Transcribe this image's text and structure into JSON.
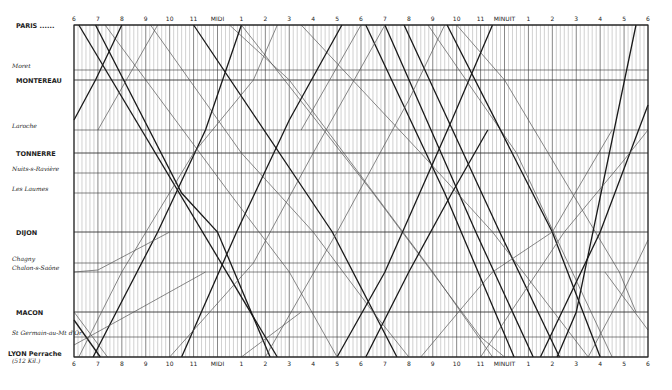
{
  "chart_data": {
    "type": "line",
    "title": "",
    "xlabel": "",
    "ylabel": "",
    "x_ticks_top": [
      "6",
      "7",
      "8",
      "9",
      "10",
      "11",
      "MIDI",
      "1",
      "2",
      "3",
      "4",
      "5",
      "6",
      "7",
      "8",
      "9",
      "10",
      "11",
      "MINUIT",
      "1",
      "2",
      "3",
      "4",
      "5",
      "6"
    ],
    "x_ticks_bottom": [
      "6",
      "7",
      "8",
      "9",
      "10",
      "11",
      "MIDI",
      "1",
      "2",
      "3",
      "4",
      "5",
      "6",
      "7",
      "8",
      "9",
      "10",
      "11",
      "MINUIT",
      "1",
      "2",
      "3",
      "4",
      "5",
      "6"
    ],
    "x_range_hours": [
      6,
      30
    ],
    "grid": true,
    "stations": [
      {
        "name": "PARIS",
        "suffix": "......",
        "y": 25,
        "style": "major"
      },
      {
        "name": "Moret",
        "y": 70,
        "style": "minor"
      },
      {
        "name": "MONTEREAU",
        "y": 80,
        "style": "major"
      },
      {
        "name": "Laroche",
        "y": 130,
        "style": "minor"
      },
      {
        "name": "TONNERRE",
        "y": 153,
        "style": "major"
      },
      {
        "name": "Nuits-s-Ravière",
        "y": 173,
        "style": "minor"
      },
      {
        "name": "Les Laumes",
        "y": 193,
        "style": "minor"
      },
      {
        "name": "DIJON",
        "y": 232,
        "style": "major"
      },
      {
        "name": "Chagny",
        "y": 263,
        "style": "minor"
      },
      {
        "name": "Chalon-s-Saône",
        "y": 272,
        "style": "minor"
      },
      {
        "name": "MACON",
        "y": 312,
        "style": "major"
      },
      {
        "name": "St Germain-au-Mt d'Or",
        "y": 337,
        "style": "minor"
      },
      {
        "name": "LYON Perrache",
        "sub": "(512 Kil.)",
        "y": 357,
        "style": "major"
      }
    ],
    "series": [
      {
        "name": "down-express-1",
        "dir": "PL",
        "bold": true,
        "points": [
          [
            6.2,
            25
          ],
          [
            14.5,
            357
          ]
        ]
      },
      {
        "name": "down-2",
        "dir": "PL",
        "bold": true,
        "points": [
          [
            6.9,
            25
          ],
          [
            10.5,
            193
          ],
          [
            12.0,
            232
          ],
          [
            14.2,
            357
          ]
        ]
      },
      {
        "name": "down-3",
        "dir": "PL",
        "bold": false,
        "points": [
          [
            7.3,
            25
          ],
          [
            9.0,
            80
          ],
          [
            12.5,
            193
          ],
          [
            15.0,
            272
          ],
          [
            17.0,
            357
          ]
        ]
      },
      {
        "name": "down-4",
        "dir": "PL",
        "bold": true,
        "points": [
          [
            11.0,
            25
          ],
          [
            16.8,
            232
          ],
          [
            19.5,
            357
          ]
        ]
      },
      {
        "name": "down-5",
        "dir": "PL",
        "bold": false,
        "points": [
          [
            9.2,
            25
          ],
          [
            13.0,
            153
          ],
          [
            16.0,
            232
          ],
          [
            18.5,
            312
          ],
          [
            20.0,
            357
          ]
        ]
      },
      {
        "name": "down-6",
        "dir": "PL",
        "bold": false,
        "points": [
          [
            13.0,
            25
          ],
          [
            18.5,
            193
          ],
          [
            23.0,
            337
          ],
          [
            24.0,
            357
          ]
        ]
      },
      {
        "name": "down-7",
        "dir": "PL",
        "bold": false,
        "points": [
          [
            12.5,
            25
          ],
          [
            15.0,
            80
          ],
          [
            21.0,
            272
          ],
          [
            23.5,
            357
          ]
        ]
      },
      {
        "name": "down-8",
        "dir": "PL",
        "bold": true,
        "points": [
          [
            18.2,
            25
          ],
          [
            21.5,
            193
          ],
          [
            24.4,
            357
          ]
        ]
      },
      {
        "name": "down-9",
        "dir": "PL",
        "bold": true,
        "points": [
          [
            19.0,
            25
          ],
          [
            22.8,
            232
          ],
          [
            25.2,
            357
          ]
        ]
      },
      {
        "name": "down-10",
        "dir": "PL",
        "bold": true,
        "points": [
          [
            19.8,
            25
          ],
          [
            23.8,
            232
          ],
          [
            26.3,
            357
          ]
        ]
      },
      {
        "name": "down-11",
        "dir": "PL",
        "bold": false,
        "points": [
          [
            20.8,
            25
          ],
          [
            24.5,
            153
          ],
          [
            28.5,
            357
          ]
        ]
      },
      {
        "name": "down-12",
        "dir": "PL",
        "bold": true,
        "points": [
          [
            21.6,
            25
          ],
          [
            26.0,
            232
          ],
          [
            28.0,
            357
          ]
        ]
      },
      {
        "name": "down-13",
        "dir": "PL",
        "bold": false,
        "points": [
          [
            22.0,
            25
          ],
          [
            24.0,
            80
          ],
          [
            28.8,
            272
          ],
          [
            29.5,
            312
          ]
        ]
      },
      {
        "name": "down-14",
        "dir": "PL",
        "bold": false,
        "points": [
          [
            15.5,
            25
          ],
          [
            20.5,
            153
          ],
          [
            23.5,
            232
          ],
          [
            27.5,
            357
          ]
        ]
      },
      {
        "name": "down-local-a",
        "dir": "PL",
        "bold": false,
        "points": [
          [
            6.0,
            312
          ],
          [
            7.4,
            357
          ]
        ]
      },
      {
        "name": "down-local-b",
        "dir": "PL",
        "bold": true,
        "points": [
          [
            6.0,
            320
          ],
          [
            7.1,
            357
          ]
        ]
      },
      {
        "name": "down-local-c",
        "dir": "PL",
        "bold": false,
        "points": [
          [
            28.2,
            272
          ],
          [
            30.0,
            330
          ]
        ]
      },
      {
        "name": "up-1",
        "dir": "LP",
        "bold": true,
        "points": [
          [
            6.0,
            120
          ],
          [
            6.9,
            80
          ],
          [
            8.0,
            25
          ]
        ]
      },
      {
        "name": "up-2",
        "dir": "LP",
        "bold": true,
        "points": [
          [
            6.8,
            357
          ],
          [
            9.5,
            232
          ],
          [
            11.5,
            130
          ],
          [
            13.0,
            25
          ]
        ]
      },
      {
        "name": "up-3",
        "dir": "LP",
        "bold": false,
        "points": [
          [
            6.2,
            357
          ],
          [
            8.0,
            272
          ],
          [
            11.0,
            153
          ],
          [
            13.5,
            80
          ],
          [
            14.5,
            25
          ]
        ]
      },
      {
        "name": "up-4",
        "dir": "LP",
        "bold": true,
        "points": [
          [
            10.5,
            357
          ],
          [
            12.8,
            232
          ],
          [
            15.0,
            120
          ],
          [
            17.2,
            25
          ]
        ]
      },
      {
        "name": "up-5",
        "dir": "LP",
        "bold": false,
        "points": [
          [
            10.0,
            357
          ],
          [
            13.5,
            263
          ],
          [
            16.0,
            153
          ],
          [
            19.0,
            25
          ]
        ]
      },
      {
        "name": "up-6",
        "dir": "LP",
        "bold": false,
        "points": [
          [
            14.0,
            357
          ],
          [
            17.0,
            232
          ],
          [
            20.0,
            100
          ],
          [
            21.5,
            25
          ]
        ]
      },
      {
        "name": "up-7",
        "dir": "LP",
        "bold": true,
        "points": [
          [
            17.0,
            357
          ],
          [
            19.0,
            272
          ],
          [
            21.8,
            120
          ],
          [
            23.5,
            25
          ]
        ]
      },
      {
        "name": "up-8",
        "dir": "LP",
        "bold": true,
        "points": [
          [
            18.2,
            357
          ],
          [
            20.0,
            272
          ],
          [
            21.8,
            193
          ],
          [
            23.3,
            130
          ]
        ]
      },
      {
        "name": "up-9",
        "dir": "LP",
        "bold": false,
        "points": [
          [
            20.5,
            357
          ],
          [
            22.5,
            300
          ],
          [
            23.5,
            272
          ],
          [
            26.0,
            232
          ],
          [
            28.5,
            130
          ]
        ]
      },
      {
        "name": "up-10",
        "dir": "LP",
        "bold": true,
        "points": [
          [
            26.2,
            357
          ],
          [
            27.0,
            312
          ],
          [
            29.5,
            25
          ]
        ]
      },
      {
        "name": "up-11",
        "dir": "LP",
        "bold": true,
        "points": [
          [
            25.5,
            357
          ],
          [
            28.0,
            232
          ],
          [
            30.0,
            105
          ]
        ]
      },
      {
        "name": "up-12",
        "dir": "LP",
        "bold": false,
        "points": [
          [
            27.5,
            357
          ],
          [
            29.0,
            290
          ],
          [
            30.0,
            240
          ]
        ]
      },
      {
        "name": "up-13",
        "dir": "LP",
        "bold": false,
        "points": [
          [
            23.0,
            357
          ],
          [
            26.5,
            232
          ],
          [
            29.0,
            160
          ],
          [
            30.0,
            130
          ]
        ]
      },
      {
        "name": "up-local-a",
        "dir": "LP",
        "bold": false,
        "points": [
          [
            6.0,
            272
          ],
          [
            7.0,
            270
          ],
          [
            10.0,
            232
          ]
        ]
      },
      {
        "name": "up-local-b",
        "dir": "LP",
        "bold": false,
        "points": [
          [
            6.0,
            345
          ],
          [
            8.5,
            312
          ],
          [
            11.5,
            272
          ]
        ]
      },
      {
        "name": "up-local-c",
        "dir": "LP",
        "bold": false,
        "points": [
          [
            7.0,
            130
          ],
          [
            9.5,
            25
          ]
        ]
      },
      {
        "name": "up-local-d",
        "dir": "LP",
        "bold": false,
        "points": [
          [
            15.5,
            130
          ],
          [
            18.0,
            25
          ]
        ]
      },
      {
        "name": "up-local-e",
        "dir": "LP",
        "bold": false,
        "points": [
          [
            13.0,
            357
          ],
          [
            15.5,
            312
          ]
        ]
      }
    ]
  },
  "layout": {
    "plot_left": 74,
    "plot_right": 648,
    "plot_top": 25,
    "plot_bottom": 357,
    "top_label_y": 21,
    "bottom_label_y": 366,
    "paris_dots": "......"
  }
}
